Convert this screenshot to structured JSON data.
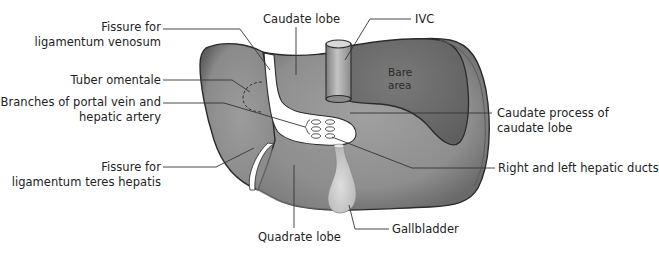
{
  "diagram": {
    "colors": {
      "liver_fill": "#8f8f8f",
      "liver_light": "#a3a3a3",
      "bare_area_fill": "#6e6e6e",
      "outline": "#2b2b2b",
      "fissure_fill": "#ffffff",
      "ivc_fill": "#9a9a9a",
      "gallbladder_fill": "#d2d2d2",
      "leader_line": "#333333",
      "text": "#222222"
    },
    "labels": {
      "fissure_venosum_line1": "Fissure for",
      "fissure_venosum_line2": "ligamentum venosum",
      "caudate_lobe": "Caudate lobe",
      "ivc": "IVC",
      "bare_area_line1": "Bare",
      "bare_area_line2": "area",
      "tuber_omentale": "Tuber omentale",
      "portal_branches_line1": "Branches of portal vein and",
      "portal_branches_line2": "hepatic artery",
      "caudate_process_line1": "Caudate process of",
      "caudate_process_line2": "caudate lobe",
      "fissure_teres_line1": "Fissure for",
      "fissure_teres_line2": "ligamentum teres hepatis",
      "hepatic_ducts": "Right and left hepatic ducts",
      "gallbladder": "Gallbladder",
      "quadrate_lobe": "Quadrate lobe"
    }
  }
}
